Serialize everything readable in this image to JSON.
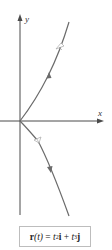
{
  "figure": {
    "axes": {
      "x_label": "x",
      "y_label": "y"
    },
    "curve": {
      "name": "semicubical parabola",
      "color": "#6b6b6b",
      "direction_arrows": 2,
      "tangent_markers": 2
    },
    "formula": {
      "lhs_vec": "r",
      "lhs_arg": "(t)",
      "equals": " = ",
      "term1_var": "t",
      "term1_exp": "2",
      "term1_unit": "i",
      "plus": " + ",
      "term2_var": "t",
      "term2_exp": "3",
      "term2_unit": "j"
    }
  },
  "colors": {
    "axis": "#4a4a4a",
    "curve": "#6b6b6b",
    "box_border": "#bdbdbd"
  }
}
